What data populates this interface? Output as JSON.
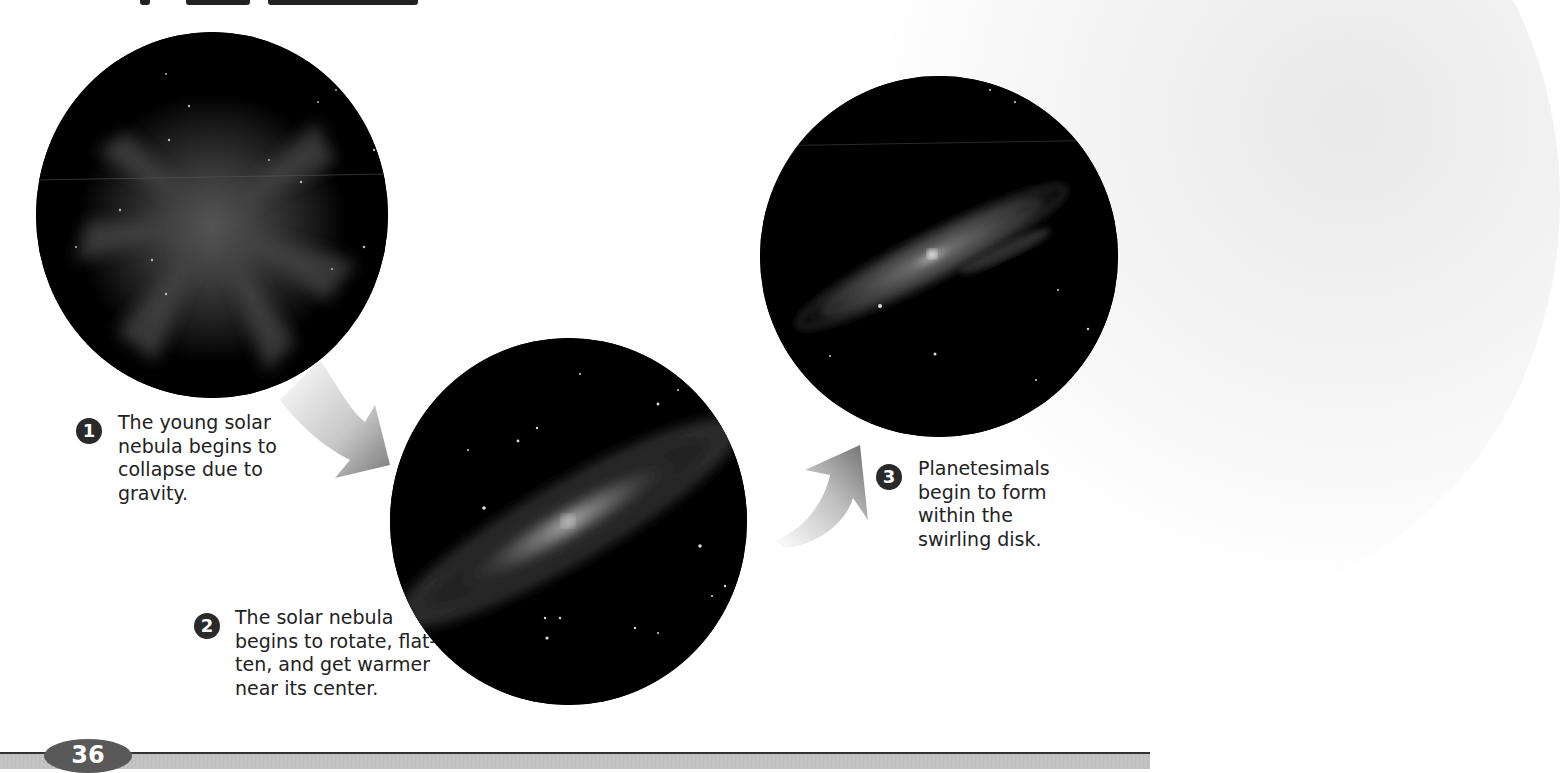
{
  "figure": {
    "steps": [
      {
        "number": "1",
        "lines": [
          "The young solar",
          "nebula begins to",
          "collapse due to",
          "gravity."
        ],
        "image": "nebula-collapsing"
      },
      {
        "number": "2",
        "lines": [
          "The solar nebula",
          "begins to rotate, flat-",
          "ten, and get warmer",
          "near its center."
        ],
        "image": "nebula-rotating-disk"
      },
      {
        "number": "3",
        "lines": [
          "Planetesimals",
          "begin to form",
          "within the",
          "swirling disk."
        ],
        "image": "planetesimal-disk"
      }
    ],
    "arrows": [
      "curved-arrow-down-right",
      "curved-arrow-up-right"
    ]
  },
  "footer": {
    "page_number": "36"
  },
  "colors": {
    "badge": "#2a2a2a",
    "text": "#222222",
    "page_tab": "#595959",
    "footer_bar": "#c0c0c0"
  }
}
